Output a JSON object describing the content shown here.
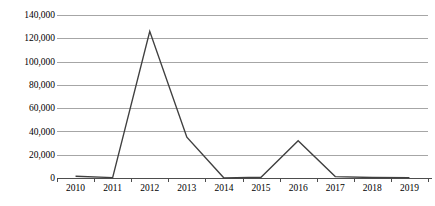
{
  "chart_data": {
    "type": "line",
    "title": "",
    "subtitle": "",
    "xlabel": "",
    "ylabel": "",
    "categories": [
      "2010",
      "2011",
      "2012",
      "2013",
      "2014",
      "2015",
      "2016",
      "2017",
      "2018",
      "2019"
    ],
    "values": [
      1500,
      300,
      126000,
      35000,
      0,
      600,
      32000,
      1200,
      400,
      300
    ],
    "series": [
      {
        "name": "",
        "values": [
          1500,
          300,
          126000,
          35000,
          0,
          600,
          32000,
          1200,
          400,
          300
        ]
      }
    ],
    "ylim": [
      0,
      140000
    ],
    "ytick_labels": [
      "140,000",
      "120,000",
      "100,000",
      "80,000",
      "60,000",
      "40,000",
      "20,000",
      "0"
    ],
    "ytick_values": [
      140000,
      120000,
      100000,
      80000,
      60000,
      40000,
      20000,
      0
    ],
    "grid": true,
    "legend": false,
    "legend_position": "none",
    "line_color": "#404040",
    "grid_color": "#a6a6a6",
    "axis_color": "#4d4d4d"
  }
}
